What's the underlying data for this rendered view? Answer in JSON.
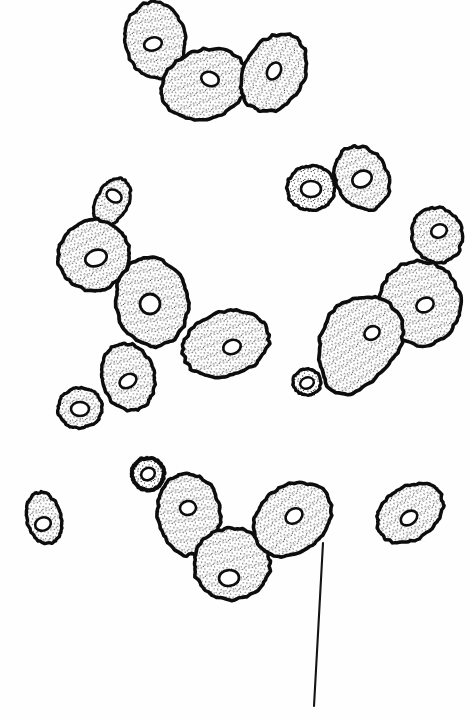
{
  "figure": {
    "background_color": "#fefefe",
    "ink_color": "#0d0d0d",
    "nucleus_fill": "#ffffff",
    "stipple_color": "#111111",
    "width": 470,
    "height": 719,
    "caption": "",
    "annotation_text": ""
  },
  "leader_line": {
    "name": "pointer-line",
    "x1": 323,
    "y1": 543,
    "x2": 314,
    "y2": 706,
    "stroke_width": 2.1
  },
  "clusters": [
    {
      "name": "top-cluster",
      "label": "three-cell chain, upper",
      "cells": [
        {
          "name": "cell-top-left-bud",
          "cx": 155,
          "cy": 40,
          "rx": 30,
          "ry": 38,
          "rot": -8,
          "sw": 3.4,
          "seed": 11,
          "nucleus": {
            "cx": 153,
            "cy": 44,
            "rx": 9,
            "ry": 6.5,
            "rot": -15,
            "sw": 2.6
          }
        },
        {
          "name": "cell-top-middle",
          "cx": 205,
          "cy": 84,
          "rx": 44,
          "ry": 34,
          "rot": -18,
          "sw": 3.6,
          "seed": 12,
          "nucleus": {
            "cx": 210,
            "cy": 79,
            "rx": 9,
            "ry": 7,
            "rot": 20,
            "sw": 2.6
          }
        },
        {
          "name": "cell-top-right",
          "cx": 274,
          "cy": 73,
          "rx": 41,
          "ry": 30,
          "rot": -62,
          "sw": 3.6,
          "seed": 13,
          "nucleus": {
            "cx": 274,
            "cy": 71,
            "rx": 9,
            "ry": 6.5,
            "rot": -60,
            "sw": 2.6
          }
        }
      ]
    },
    {
      "name": "upper-right-pair",
      "label": "two-cell pair, small bud with mother",
      "cells": [
        {
          "name": "cell-pair-small-bud",
          "cx": 311,
          "cy": 188,
          "rx": 24,
          "ry": 22,
          "rot": 0,
          "sw": 3.4,
          "seed": 21,
          "nucleus": {
            "cx": 311,
            "cy": 189,
            "rx": 10,
            "ry": 8,
            "rot": 0,
            "sw": 2.6
          }
        },
        {
          "name": "cell-pair-mother",
          "cx": 362,
          "cy": 178,
          "rx": 26,
          "ry": 33,
          "rot": -28,
          "sw": 3.5,
          "seed": 22,
          "nucleus": {
            "cx": 362,
            "cy": 179,
            "rx": 10,
            "ry": 8,
            "rot": -25,
            "sw": 2.6
          }
        }
      ]
    },
    {
      "name": "left-chain",
      "label": "six-cell branching chain, centre left",
      "cells": [
        {
          "name": "cell-left-chain-top-bud",
          "cx": 112,
          "cy": 202,
          "rx": 16,
          "ry": 25,
          "rot": 28,
          "sw": 3.2,
          "seed": 31,
          "nucleus": {
            "cx": 114,
            "cy": 196,
            "rx": 8,
            "ry": 6,
            "rot": 30,
            "sw": 2.5
          }
        },
        {
          "name": "cell-left-chain-upper",
          "cx": 94,
          "cy": 255,
          "rx": 36,
          "ry": 35,
          "rot": -30,
          "sw": 3.6,
          "seed": 32,
          "nucleus": {
            "cx": 96,
            "cy": 258,
            "rx": 11,
            "ry": 8,
            "rot": -20,
            "sw": 2.7
          }
        },
        {
          "name": "cell-left-chain-centre",
          "cx": 152,
          "cy": 302,
          "rx": 36,
          "ry": 44,
          "rot": -8,
          "sw": 3.7,
          "seed": 33,
          "nucleus": {
            "cx": 150,
            "cy": 304,
            "rx": 10,
            "ry": 10,
            "rot": 0,
            "sw": 2.8
          }
        },
        {
          "name": "cell-left-chain-right",
          "cx": 226,
          "cy": 344,
          "rx": 44,
          "ry": 32,
          "rot": -18,
          "sw": 3.6,
          "seed": 34,
          "nucleus": {
            "cx": 232,
            "cy": 347,
            "rx": 9,
            "ry": 7,
            "rot": -20,
            "sw": 2.6
          }
        },
        {
          "name": "cell-left-chain-lower",
          "cx": 128,
          "cy": 377,
          "rx": 26,
          "ry": 34,
          "rot": -14,
          "sw": 3.5,
          "seed": 35,
          "nucleus": {
            "cx": 128,
            "cy": 381,
            "rx": 9,
            "ry": 6.5,
            "rot": -30,
            "sw": 2.6
          }
        },
        {
          "name": "cell-left-chain-small",
          "cx": 80,
          "cy": 408,
          "rx": 22,
          "ry": 20,
          "rot": -10,
          "sw": 3.4,
          "seed": 36,
          "nucleus": {
            "cx": 80,
            "cy": 409,
            "rx": 9,
            "ry": 7,
            "rot": 0,
            "sw": 2.6
          }
        }
      ]
    },
    {
      "name": "right-chain",
      "label": "budding chain with pear-shaped mother cell",
      "cells": [
        {
          "name": "cell-right-chain-top-bud",
          "cx": 437,
          "cy": 235,
          "rx": 25,
          "ry": 28,
          "rot": -20,
          "sw": 3.4,
          "seed": 41,
          "nucleus": {
            "cx": 439,
            "cy": 231,
            "rx": 8,
            "ry": 6.5,
            "rot": -20,
            "sw": 2.6
          }
        },
        {
          "name": "cell-right-chain-daughter",
          "cx": 420,
          "cy": 303,
          "rx": 40,
          "ry": 42,
          "rot": -15,
          "sw": 3.6,
          "seed": 42,
          "nucleus": {
            "cx": 425,
            "cy": 305,
            "rx": 9,
            "ry": 7,
            "rot": -25,
            "sw": 2.6
          }
        },
        {
          "name": "cell-right-chain-mother-pear",
          "cx": 362,
          "cy": 336,
          "rx": 42,
          "ry": 38,
          "rot": -35,
          "sw": 3.7,
          "seed": 43,
          "pear": true,
          "nucleus": {
            "cx": 372,
            "cy": 333,
            "rx": 8,
            "ry": 6.5,
            "rot": -30,
            "sw": 2.6
          }
        },
        {
          "name": "cell-right-chain-tiny-bud",
          "cx": 307,
          "cy": 382,
          "rx": 14,
          "ry": 13,
          "rot": 0,
          "sw": 3.2,
          "seed": 44,
          "nucleus": {
            "cx": 307,
            "cy": 383,
            "rx": 7,
            "ry": 5.5,
            "rot": -20,
            "sw": 2.4
          }
        }
      ]
    },
    {
      "name": "bottom-cluster",
      "label": "lower chain with emerging bud",
      "cells": [
        {
          "name": "cell-bottom-emerging-bud",
          "cx": 148,
          "cy": 474,
          "rx": 16,
          "ry": 16,
          "rot": 0,
          "sw": 4.2,
          "seed": 51,
          "nucleus": {
            "cx": 148,
            "cy": 474,
            "rx": 7,
            "ry": 6,
            "rot": -25,
            "sw": 2.6
          }
        },
        {
          "name": "cell-bottom-left",
          "cx": 189,
          "cy": 514,
          "rx": 31,
          "ry": 41,
          "rot": -6,
          "sw": 3.6,
          "seed": 52,
          "nucleus": {
            "cx": 188,
            "cy": 508,
            "rx": 8,
            "ry": 7,
            "rot": -10,
            "sw": 2.6
          }
        },
        {
          "name": "cell-bottom-middle",
          "cx": 232,
          "cy": 564,
          "rx": 38,
          "ry": 36,
          "rot": -12,
          "sw": 3.6,
          "seed": 53,
          "nucleus": {
            "cx": 229,
            "cy": 578,
            "rx": 10,
            "ry": 8,
            "rot": -5,
            "sw": 2.7
          }
        },
        {
          "name": "cell-bottom-right",
          "cx": 292,
          "cy": 519,
          "rx": 42,
          "ry": 33,
          "rot": -38,
          "sw": 3.6,
          "seed": 54,
          "nucleus": {
            "cx": 294,
            "cy": 516,
            "rx": 9,
            "ry": 7,
            "rot": -35,
            "sw": 2.6
          }
        }
      ]
    },
    {
      "name": "isolated-cells",
      "label": "two single cells",
      "cells": [
        {
          "name": "cell-isolated-left",
          "cx": 44,
          "cy": 518,
          "rx": 17,
          "ry": 26,
          "rot": -14,
          "sw": 3.4,
          "seed": 61,
          "nucleus": {
            "cx": 43,
            "cy": 524,
            "rx": 8,
            "ry": 6.5,
            "rot": -20,
            "sw": 2.6
          }
        },
        {
          "name": "cell-isolated-right",
          "cx": 410,
          "cy": 513,
          "rx": 36,
          "ry": 26,
          "rot": -36,
          "sw": 3.5,
          "seed": 62,
          "nucleus": {
            "cx": 409,
            "cy": 518,
            "rx": 9,
            "ry": 6.5,
            "rot": -35,
            "sw": 2.6
          }
        }
      ]
    }
  ]
}
